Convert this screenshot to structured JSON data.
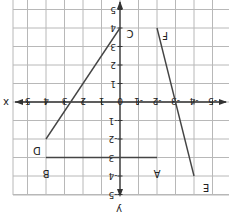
{
  "figure": {
    "rotation_deg": 180,
    "axes": {
      "x_label": "x",
      "y_label": "y",
      "x_ticks": [
        "-5",
        "-4",
        "-3",
        "-2",
        "-1",
        "0",
        "1",
        "2",
        "3",
        "4",
        "5"
      ],
      "y_ticks": [
        "-5",
        "-4",
        "-3",
        "-2",
        "-1",
        "1",
        "2",
        "3",
        "4",
        "5"
      ],
      "origin_label": "0"
    },
    "points": [
      {
        "label": "A",
        "x": -2,
        "y": -3
      },
      {
        "label": "B",
        "x": 4,
        "y": -3
      },
      {
        "label": "C",
        "x": 0,
        "y": 4
      },
      {
        "label": "D",
        "x": 4,
        "y": -2
      },
      {
        "label": "E",
        "x": -4,
        "y": -4
      },
      {
        "label": "F",
        "x": -2,
        "y": 4
      }
    ],
    "segments": [
      {
        "name": "AB",
        "from": "A",
        "to": "B"
      },
      {
        "name": "CD",
        "from": "C",
        "to": "D"
      },
      {
        "name": "EF",
        "from": "E",
        "to": "F"
      }
    ],
    "colors": {
      "grid": "#b8b8b8",
      "axis": "#333333",
      "segment": "#444444",
      "text": "#222222",
      "background": "#ffffff"
    }
  }
}
